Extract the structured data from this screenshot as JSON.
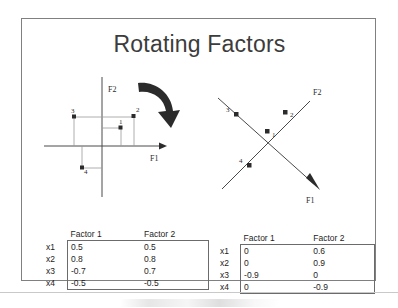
{
  "slide": {
    "title": "Rotating Factors"
  },
  "figures": {
    "left": {
      "name": "unrotated-factor-plot",
      "axis_x_label": "F1",
      "axis_y_label": "F2",
      "point_labels": [
        "1",
        "2",
        "3",
        "4"
      ],
      "rotation_arrow": "clockwise-curved-arrow"
    },
    "right": {
      "name": "rotated-factor-plot",
      "axis_x_label": "F1",
      "axis_y_label": "F2",
      "point_labels": [
        "1",
        "2",
        "3",
        "4"
      ]
    }
  },
  "tables": {
    "left": {
      "caption": "unrotated-loadings",
      "columns": [
        "Factor 1",
        "Factor 2"
      ],
      "rows": [
        {
          "label": "x1",
          "values": [
            "0.5",
            "0.5"
          ]
        },
        {
          "label": "x2",
          "values": [
            "0.8",
            "0.8"
          ]
        },
        {
          "label": "x3",
          "values": [
            "-0.7",
            "0.7"
          ]
        },
        {
          "label": "x4",
          "values": [
            "-0.5",
            "-0.5"
          ]
        }
      ]
    },
    "right": {
      "caption": "rotated-loadings",
      "columns": [
        "Factor 1",
        "Factor 2"
      ],
      "rows": [
        {
          "label": "x1",
          "values": [
            "0",
            "0.6"
          ]
        },
        {
          "label": "x2",
          "values": [
            "0",
            "0.9"
          ]
        },
        {
          "label": "x3",
          "values": [
            "-0.9",
            "0"
          ]
        },
        {
          "label": "x4",
          "values": [
            "0",
            "-0.9"
          ]
        }
      ]
    }
  },
  "colors": {
    "title": "#3c3c3c",
    "frame": "#808080",
    "axis": "#4a4a4a",
    "grid": "#9a9a9a",
    "marker": "#2b2b2b",
    "divider": "#c9c9c9"
  }
}
